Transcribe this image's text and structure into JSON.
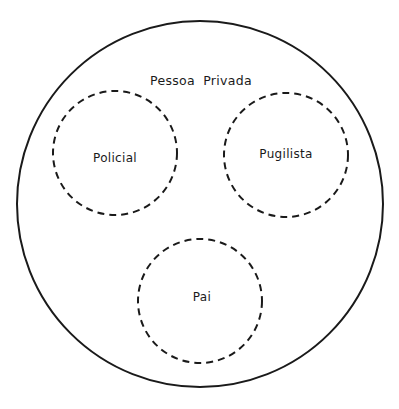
{
  "diagram": {
    "outer": {
      "label": "Pessoa Privada",
      "cx": 200,
      "cy": 204,
      "r": 183
    },
    "roles": [
      {
        "label": "Policial",
        "cx": 115,
        "cy": 153,
        "r": 62
      },
      {
        "label": "Pugilista",
        "cx": 286,
        "cy": 155,
        "r": 62
      },
      {
        "label": "Pai",
        "cx": 200,
        "cy": 301,
        "r": 62
      }
    ],
    "colors": {
      "stroke": "#1a1a1a",
      "background": "#ffffff"
    }
  }
}
